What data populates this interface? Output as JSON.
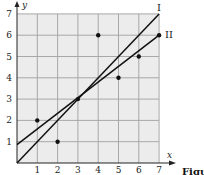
{
  "chart_data": {
    "type": "scatter",
    "title": "",
    "xlabel": "x",
    "ylabel": "y",
    "xlim": [
      0,
      7
    ],
    "ylim": [
      0,
      7
    ],
    "grid": true,
    "x_ticks": [
      "1",
      "2",
      "3",
      "4",
      "5",
      "6",
      "7"
    ],
    "y_ticks": [
      "1",
      "2",
      "3",
      "4",
      "5",
      "6",
      "7"
    ],
    "points": [
      {
        "x": 1,
        "y": 2
      },
      {
        "x": 2,
        "y": 1
      },
      {
        "x": 3,
        "y": 3
      },
      {
        "x": 4,
        "y": 6
      },
      {
        "x": 5,
        "y": 4
      },
      {
        "x": 6,
        "y": 5
      },
      {
        "x": 7,
        "y": 6
      }
    ],
    "lines": [
      {
        "name": "I",
        "from": {
          "x": 0,
          "y": 0
        },
        "to": {
          "x": 7,
          "y": 7
        }
      },
      {
        "name": "II",
        "from": {
          "x": 0,
          "y": 0.86
        },
        "to": {
          "x": 7,
          "y": 6
        }
      }
    ],
    "annotations": [
      "I",
      "II"
    ],
    "caption_fragment": "Figu"
  },
  "colors": {
    "grid_bg": "#ececec",
    "grid_line": "#a8a8a8",
    "axis": "#222222",
    "ink": "#111111"
  }
}
